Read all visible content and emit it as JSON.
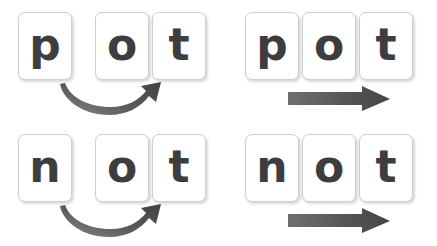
{
  "canvas": {
    "width": 437,
    "height": 246,
    "background_color": "#ffffff"
  },
  "palette": {
    "tile_background": "#ffffff",
    "tile_border": "#cfcfcf",
    "letter_color": "#3d3d3d",
    "arrow_dark": "#4a4a4a",
    "arrow_light": "#7d7d7d"
  },
  "groups": [
    {
      "id": "top-left",
      "word": "pot",
      "arrow_type": "curved",
      "arrow_name": "curved-arrow",
      "spacing": "split",
      "tiles": [
        {
          "letter": "p",
          "x": 18,
          "y": 12
        },
        {
          "letter": "o",
          "x": 95,
          "y": 12
        },
        {
          "letter": "t",
          "x": 152,
          "y": 12
        }
      ]
    },
    {
      "id": "top-right",
      "word": "pot",
      "arrow_type": "straight",
      "arrow_name": "straight-arrow",
      "spacing": "joined",
      "tiles": [
        {
          "letter": "p",
          "x": 245,
          "y": 12
        },
        {
          "letter": "o",
          "x": 302,
          "y": 12
        },
        {
          "letter": "t",
          "x": 359,
          "y": 12
        }
      ]
    },
    {
      "id": "bottom-left",
      "word": "not",
      "arrow_type": "curved",
      "arrow_name": "curved-arrow",
      "spacing": "split",
      "tiles": [
        {
          "letter": "n",
          "x": 18,
          "y": 134
        },
        {
          "letter": "o",
          "x": 95,
          "y": 134
        },
        {
          "letter": "t",
          "x": 152,
          "y": 134
        }
      ]
    },
    {
      "id": "bottom-right",
      "word": "not",
      "arrow_type": "straight",
      "arrow_name": "straight-arrow",
      "spacing": "joined",
      "tiles": [
        {
          "letter": "n",
          "x": 245,
          "y": 134
        },
        {
          "letter": "o",
          "x": 302,
          "y": 134
        },
        {
          "letter": "t",
          "x": 359,
          "y": 134
        }
      ]
    }
  ],
  "arrows": [
    {
      "id": "arrow-top-left",
      "type": "curved",
      "x": 57,
      "y": 82
    },
    {
      "id": "arrow-top-right",
      "type": "straight",
      "x": 288,
      "y": 86
    },
    {
      "id": "arrow-bottom-left",
      "type": "curved",
      "x": 57,
      "y": 204
    },
    {
      "id": "arrow-bottom-right",
      "type": "straight",
      "x": 288,
      "y": 208
    }
  ]
}
